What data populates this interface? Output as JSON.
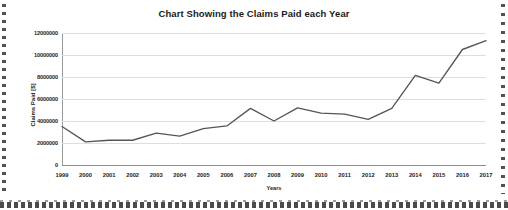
{
  "chart_data": {
    "type": "line",
    "title": "Chart Showing the Claims Paid each Year",
    "xlabel": "Years",
    "ylabel": "Claims Paid [$]",
    "categories": [
      1999,
      2000,
      2001,
      2002,
      2003,
      2004,
      2005,
      2006,
      2007,
      2008,
      2009,
      2010,
      2011,
      2012,
      2013,
      2014,
      2015,
      2016,
      2017
    ],
    "tick_labels_x": [
      "1999",
      "2000",
      "2001",
      "2002",
      "2003",
      "2004",
      "2005",
      "2006",
      "2007",
      "2008",
      "2009",
      "2010",
      "2011",
      "2012",
      "2013",
      "2014",
      "2015",
      "2016",
      "2017"
    ],
    "tick_labels_y": [
      "0",
      "2000000",
      "4000000",
      "6000000",
      "8000000",
      "10000000",
      "12000000"
    ],
    "tick_values_y": [
      0,
      2000000,
      4000000,
      6000000,
      8000000,
      10000000,
      12000000
    ],
    "ylim": [
      0,
      12000000
    ],
    "values": [
      3500000,
      2100000,
      2250000,
      2250000,
      2900000,
      2620000,
      3300000,
      3550000,
      5150000,
      4000000,
      5200000,
      4720000,
      4620000,
      4150000,
      5150000,
      8150000,
      7450000,
      10500000,
      11300000
    ],
    "series": [
      {
        "name": "Claims Paid",
        "color": "#555555",
        "values": [
          3500000,
          2100000,
          2250000,
          2250000,
          2900000,
          2620000,
          3300000,
          3550000,
          5150000,
          4000000,
          5200000,
          4720000,
          4620000,
          4150000,
          5150000,
          8150000,
          7450000,
          10500000,
          11300000
        ]
      }
    ],
    "grid": true,
    "grid_axis": "y",
    "legend": false,
    "legend_position": "none",
    "markers": false
  },
  "figure": {
    "background_color": "#ffffff",
    "line_color": "#555555",
    "grid_color": "#dedede",
    "text_color": "#1b1b1b"
  }
}
